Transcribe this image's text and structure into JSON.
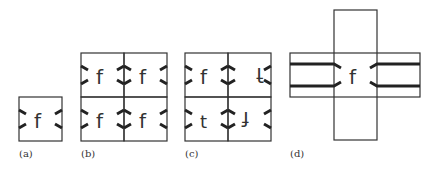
{
  "figure": {
    "panels": [
      {
        "id": "a",
        "label": "(a)",
        "description": "single tile with glyph f and edge marks"
      },
      {
        "id": "b",
        "label": "(b)",
        "description": "2x2 grid, tile translated"
      },
      {
        "id": "c",
        "label": "(c)",
        "description": "2x2 grid, tile with rotations/reflections"
      },
      {
        "id": "d",
        "label": "(d)",
        "description": "cross of tiles with continuous horizontal bands"
      }
    ],
    "glyphs": {
      "f": "f",
      "t": "t",
      "f_rot": "ꟻ"
    },
    "colors": {
      "stroke": "#333333",
      "mark": "#222222",
      "background": "#ffffff"
    }
  }
}
